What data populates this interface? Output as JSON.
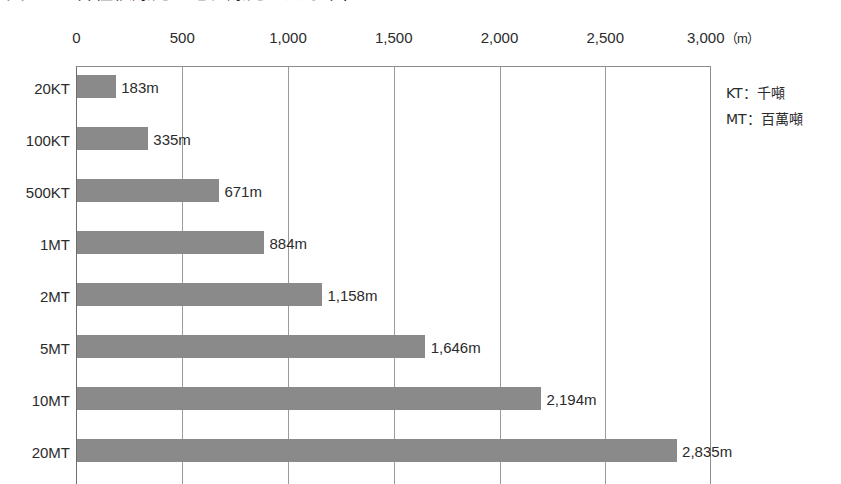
{
  "figure": {
    "title_cropped": "図5-4　各種核爆発の地表爆発の火球半径",
    "title_visible_note": "title row is cut off at top edge of screenshot"
  },
  "legend": {
    "lines": [
      "KT：千噸",
      "MT：百萬噸"
    ]
  },
  "axis": {
    "unit_label": "（m）",
    "tick_labels": [
      "0",
      "500",
      "1,000",
      "1,500",
      "2,000",
      "2,500",
      "3,000"
    ]
  },
  "colors": {
    "bar_fill": "#8a8a8a",
    "axis": "#6e6e6e",
    "gridline": "#9a9a9a",
    "text": "#2b2b2b",
    "background": "#ffffff"
  },
  "chart_data": {
    "type": "bar",
    "orientation": "horizontal",
    "title": "図5-4　各種核爆発の地表爆発の火球半径",
    "xlabel": "（m）",
    "ylabel": "",
    "xlim": [
      0,
      3000
    ],
    "xticks": [
      0,
      500,
      1000,
      1500,
      2000,
      2500,
      3000
    ],
    "xtick_labels": [
      "0",
      "500",
      "1,000",
      "1,500",
      "2,000",
      "2,500",
      "3,000"
    ],
    "grid": true,
    "grid_axis": "x",
    "legend_position": "right-outside",
    "categories": [
      "20KT",
      "100KT",
      "500KT",
      "1MT",
      "2MT",
      "5MT",
      "10MT",
      "20MT"
    ],
    "values": [
      183,
      335,
      671,
      884,
      1158,
      1646,
      2194,
      2835
    ],
    "value_labels": [
      "183m",
      "335m",
      "671m",
      "884m",
      "1,158m",
      "1,646m",
      "2,194m",
      "2,835m"
    ],
    "value_unit": "m",
    "series": [
      {
        "name": "火球半径",
        "values": [
          183,
          335,
          671,
          884,
          1158,
          1646,
          2194,
          2835
        ]
      }
    ],
    "annotations": [
      "KT：千噸",
      "MT：百萬噸"
    ]
  }
}
